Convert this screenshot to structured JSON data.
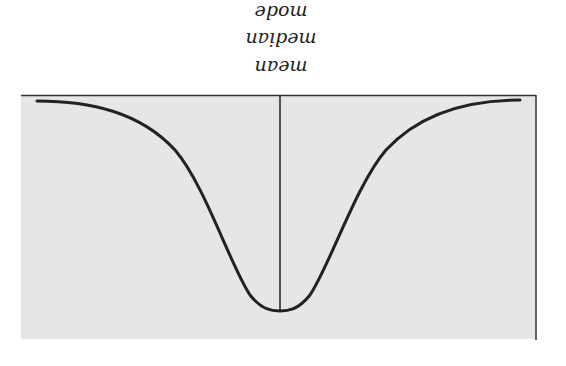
{
  "figure": {
    "orientation": "rotated 180 degrees",
    "labels": {
      "line1": "mean",
      "line2": "median",
      "line3": "mode"
    },
    "colors": {
      "plot_background": "#e6e6e6",
      "curve": "#222222",
      "frame": "#333333",
      "page": "#ffffff"
    }
  }
}
